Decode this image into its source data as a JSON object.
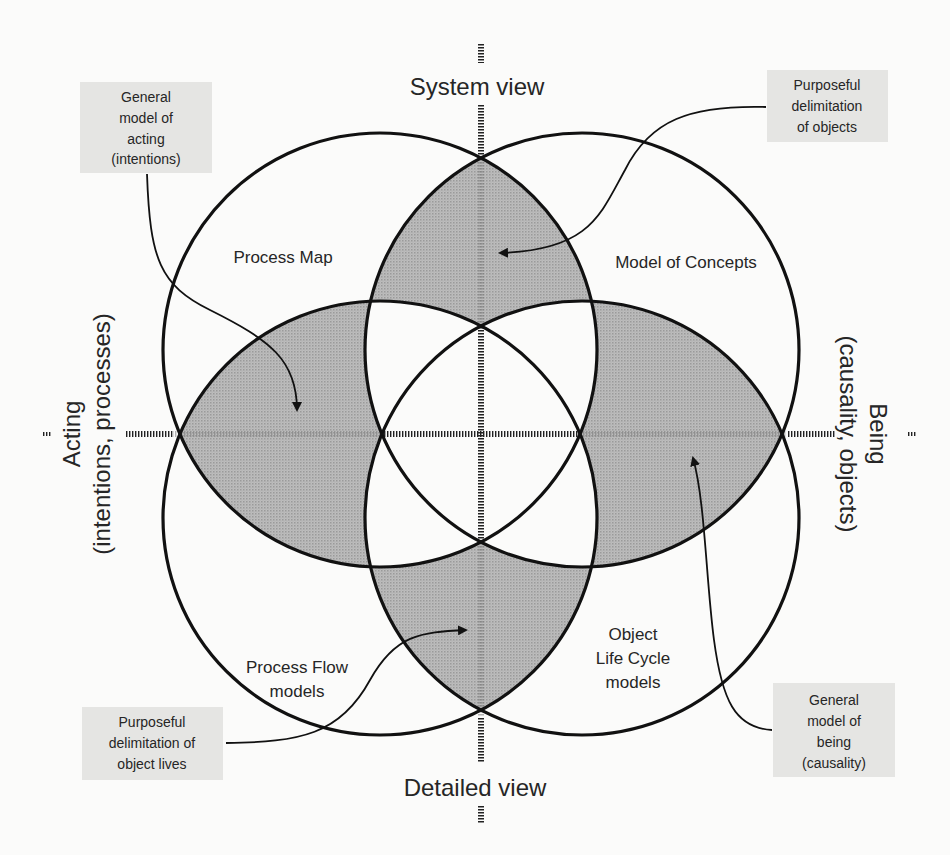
{
  "diagram": {
    "axes": {
      "top": "System view",
      "bottom": "Detailed view",
      "left": {
        "line1": "Acting",
        "line2": "(intentions, processes)"
      },
      "right": {
        "line1": "Being",
        "line2": "(causality, objects)"
      }
    },
    "regions": {
      "upper_left": "Process Map",
      "upper_right": "Model of Concepts",
      "lower_left": {
        "line1": "Process Flow",
        "line2": "models"
      },
      "lower_right": {
        "line1": "Object",
        "line2": "Life Cycle",
        "line3": "models"
      }
    },
    "callouts": {
      "top_left": {
        "line1": "General",
        "line2": "model of",
        "line3": "acting",
        "line4": "(intentions)"
      },
      "top_right": {
        "line1": "Purposeful",
        "line2": "delimitation",
        "line3": "of objects"
      },
      "bottom_left": {
        "line1": "Purposeful",
        "line2": "delimitation of",
        "line3": "object lives"
      },
      "bottom_right": {
        "line1": "General",
        "line2": "model of",
        "line3": "being",
        "line4": "(causality)"
      }
    },
    "colors": {
      "background": "#fbfbfa",
      "shaded_overlap": "#b2b2b2",
      "callout_box": "#e5e5e3",
      "stroke": "#111111"
    }
  }
}
